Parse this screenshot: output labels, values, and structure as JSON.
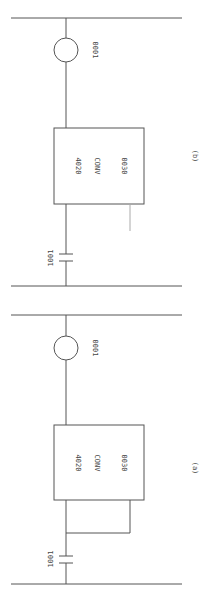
{
  "diagrams": [
    {
      "id": "b",
      "caption": "(b)",
      "coil_label": "0001",
      "block": {
        "line1": "4020",
        "line2": "CONV",
        "line3": "0030"
      },
      "contact_label": "1001",
      "variant": "stub output (unconnected)"
    },
    {
      "id": "a",
      "caption": "(a)",
      "coil_label": "0001",
      "block": {
        "line1": "4020",
        "line2": "CONV",
        "line3": "0030"
      },
      "contact_label": "1001",
      "variant": "output looped back to input"
    }
  ],
  "colors": {
    "line": "#555555",
    "text": "#444444",
    "background": "#ffffff"
  }
}
